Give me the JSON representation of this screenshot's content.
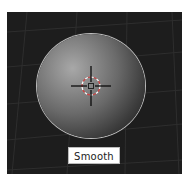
{
  "viewport": {
    "background": "#1d1d1d",
    "object": "sphere",
    "shading_label": "Smooth",
    "cursor_icon": "3d-cursor-icon",
    "colors": {
      "sphere_highlight": "#a8a8a8",
      "sphere_shadow": "#141414",
      "outline": "#bdbdbd",
      "cursor_ring_a": "#d04040",
      "cursor_ring_b": "#ffffff"
    }
  }
}
